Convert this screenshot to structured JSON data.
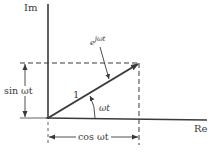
{
  "diagram": {
    "type": "phasor-complex-plane",
    "axes": {
      "vertical_label": "Im",
      "horizontal_label": "Re"
    },
    "phasor": {
      "magnitude_label": "1",
      "angle_label": "ωt",
      "name_base": "e",
      "name_exponent": "jωt"
    },
    "projections": {
      "vertical_label": "sin ωt",
      "horizontal_label": "cos ωt"
    },
    "colors": {
      "line": "#3a3a3a",
      "background": "#ffffff"
    }
  }
}
